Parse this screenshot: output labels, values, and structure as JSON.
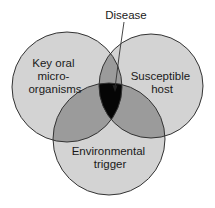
{
  "diagram": {
    "type": "venn",
    "title_label": "Disease",
    "circles": [
      {
        "id": "microorganisms",
        "lines": [
          "Key oral",
          "micro-",
          "organisms"
        ]
      },
      {
        "id": "host",
        "lines": [
          "Susceptible",
          "host"
        ]
      },
      {
        "id": "environment",
        "lines": [
          "Environmental",
          "trigger"
        ]
      }
    ],
    "intersection_label": "Disease",
    "colors": {
      "single": "#d3d3d3",
      "double": "#9b9b9b",
      "triple": "#050505",
      "stroke": "#333333"
    }
  }
}
